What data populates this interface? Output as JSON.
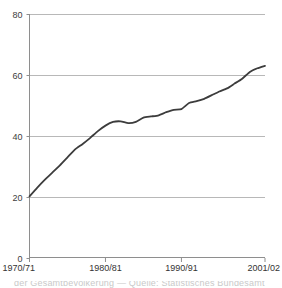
{
  "chart_data": {
    "type": "line",
    "title": "",
    "subtitle": "",
    "xlabel": "",
    "ylabel": "",
    "ylim": [
      0,
      80
    ],
    "yticks": [
      0,
      20,
      40,
      60,
      80
    ],
    "ytick_labels": [
      "0",
      "20",
      "40",
      "60",
      "80"
    ],
    "grid": true,
    "grid_axis": "y",
    "legend": false,
    "legend_position": "none",
    "xtick_labels": [
      "1970/71",
      "1980/81",
      "1990/91",
      "2001/02"
    ],
    "xtick_values": [
      "1970/71",
      "1980/81",
      "1990/91",
      "2001/02"
    ],
    "x": [
      "1970/71",
      "1971/72",
      "1972/73",
      "1973/74",
      "1974/75",
      "1975/76",
      "1976/77",
      "1977/78",
      "1978/79",
      "1979/80",
      "1980/81",
      "1981/82",
      "1982/83",
      "1983/84",
      "1984/85",
      "1985/86",
      "1986/87",
      "1987/88",
      "1988/89",
      "1989/90",
      "1990/91",
      "1991/92",
      "1992/93",
      "1993/94",
      "1994/95",
      "1995/96",
      "1996/97",
      "1997/98",
      "1998/99",
      "1999/00",
      "2000/01",
      "2001/02"
    ],
    "series": [
      {
        "name": "Value",
        "color": "#3c3c3c",
        "values": [
          20.2,
          23.0,
          25.6,
          28.0,
          30.4,
          33.0,
          35.6,
          37.4,
          39.4,
          41.6,
          43.4,
          44.6,
          44.8,
          44.2,
          44.6,
          46.0,
          46.4,
          46.8,
          47.8,
          48.6,
          48.8,
          50.8,
          51.4,
          52.2,
          53.4,
          54.6,
          55.6,
          57.2,
          58.8,
          61.0,
          62.2,
          63.0
        ]
      }
    ],
    "axis_color": "#8e8e8e",
    "grid_color": "#b8b8b8",
    "line_color": "#3c3c3c",
    "line_width": 1.8,
    "background": "#ffffff"
  },
  "caption": {
    "clipped_line": "der Gesamtbevölkerung — Quelle: Statistisches Bundesamt"
  }
}
